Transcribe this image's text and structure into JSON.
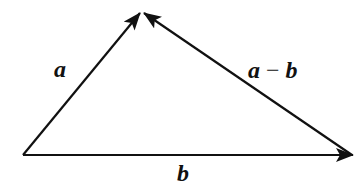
{
  "diagram": {
    "type": "vector-triangle",
    "vertices": {
      "origin": {
        "x": 23,
        "y": 155
      },
      "apex": {
        "x": 142,
        "y": 12
      },
      "right": {
        "x": 352,
        "y": 155
      }
    },
    "vectors": [
      {
        "id": "a",
        "label": "a",
        "from": "origin",
        "to": "apex",
        "label_pos": {
          "x": 54,
          "y": 77
        }
      },
      {
        "id": "b",
        "label": "b",
        "from": "origin",
        "to": "right",
        "label_pos": {
          "x": 177,
          "y": 181
        }
      },
      {
        "id": "a-minus-b",
        "label_a": "a",
        "label_op": " − ",
        "label_b": "b",
        "from": "right",
        "to": "apex",
        "label_pos": {
          "x": 248,
          "y": 78
        }
      }
    ],
    "stroke_color": "#111111",
    "background": "#ffffff"
  }
}
